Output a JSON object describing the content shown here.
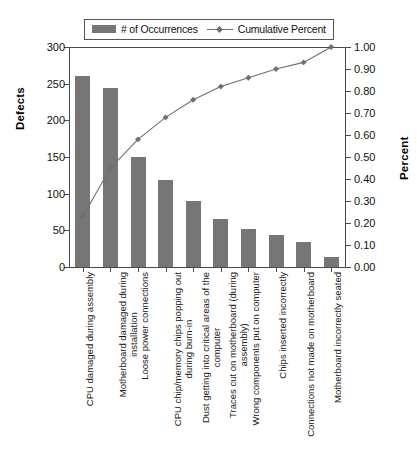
{
  "chart_data": {
    "type": "bar",
    "title": "",
    "xlabel": "",
    "ylabel": "Defects",
    "y2label": "Percent",
    "ylim": [
      0,
      300
    ],
    "y2lim": [
      0.0,
      1.0
    ],
    "grid": false,
    "legend_position": "top-center",
    "categories": [
      "CPU damaged during assembly",
      "Motherboard damaged during installation",
      "Loose power connections",
      "CPU chip/memory chips popping out during burn-in",
      "Dust getting into critical areas of the computer",
      "Traces cut on motherboard (during assembly)",
      "Wrong components put on computer",
      "Chips inserted incorrectly",
      "Connections not made on motherboard",
      "Motherboard incorrectly seated"
    ],
    "series": [
      {
        "name": "# of Occurrences",
        "type": "bar",
        "axis": "left",
        "color": "#767676",
        "values": [
          260,
          244,
          150,
          118,
          90,
          65,
          52,
          44,
          34,
          14
        ]
      },
      {
        "name": "Cumulative Percent",
        "type": "line",
        "axis": "right",
        "color": "#6f6f6f",
        "values": [
          0.23,
          0.45,
          0.58,
          0.68,
          0.76,
          0.82,
          0.86,
          0.9,
          0.93,
          1.0
        ]
      }
    ],
    "y_ticks": [
      "0",
      "50",
      "100",
      "150",
      "200",
      "250",
      "300"
    ],
    "y_tick_values": [
      0,
      50,
      100,
      150,
      200,
      250,
      300
    ],
    "y2_ticks": [
      "0.00",
      "0.10",
      "0.20",
      "0.30",
      "0.40",
      "0.50",
      "0.60",
      "0.70",
      "0.80",
      "0.90",
      "1.00"
    ],
    "y2_tick_values": [
      0.0,
      0.1,
      0.2,
      0.3,
      0.4,
      0.5,
      0.6,
      0.7,
      0.8,
      0.9,
      1.0
    ]
  },
  "legend": {
    "bar_label": "# of Occurrences",
    "line_label": "Cumulative Percent",
    "bar_swatch_icon": "bar-swatch-icon",
    "line_swatch_icon": "line-marker-swatch-icon"
  },
  "category_label_lines": [
    [
      "CPU damaged during assembly"
    ],
    [
      "Motherboard damaged during",
      "installation"
    ],
    [
      "Loose power connections"
    ],
    [
      "CPU chip/memory chips popping out",
      "during burn-in"
    ],
    [
      "Dust getting into critical areas of the",
      "computer"
    ],
    [
      "Traces cut on motherboard (during",
      "assembly)"
    ],
    [
      "Wrong components put on computer"
    ],
    [
      "Chips inserted incorrectly"
    ],
    [
      "Connections not made on motherboard"
    ],
    [
      "Motherboard incorrectly seated"
    ]
  ]
}
